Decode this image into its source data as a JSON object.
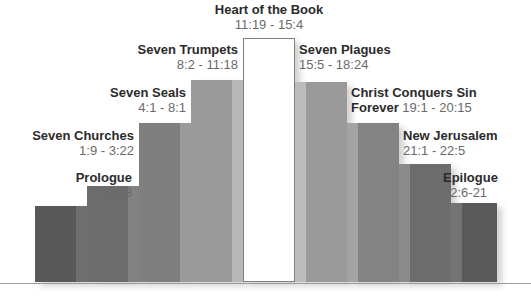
{
  "chart_data": {
    "type": "bar",
    "xlabel": "",
    "ylabel": "",
    "grid": false,
    "legend": null,
    "categories": [
      "Prologue",
      "Seven Churches",
      "Seven Seals",
      "Seven Trumpets",
      "Heart of the Book",
      "Seven Plagues",
      "Christ Conquers Sin Forever",
      "New Jerusalem",
      "Epilogue"
    ],
    "values": [
      76,
      96,
      159,
      202,
      244,
      200,
      159,
      118,
      79
    ],
    "ylim": [
      0,
      250
    ],
    "annotations": [
      "1:1-8",
      "1:9 - 3:22",
      "4:1 - 8:1",
      "8:2 - 11:18",
      "11:19 - 15:4",
      "15:5 - 18:24",
      "19:1 - 20:15",
      "21:1 - 22:5",
      "22:6-21"
    ],
    "bars": [
      {
        "index": 0,
        "side": "left",
        "title": "Prologue",
        "ref": "1:1-8",
        "fill": "#585858",
        "stripe": "#6f6f6f",
        "x": 35,
        "width": 52,
        "height": 76
      },
      {
        "index": 1,
        "side": "left",
        "title": "Seven Churches",
        "ref": "1:9 - 3:22",
        "fill": "#6c6c6c",
        "stripe": "#828282",
        "x": 87,
        "width": 52,
        "height": 96
      },
      {
        "index": 2,
        "side": "left",
        "title": "Seven Seals",
        "ref": "4:1 - 8:1",
        "fill": "#7f7f7f",
        "stripe": "#9b9b9b",
        "x": 139,
        "width": 52,
        "height": 159
      },
      {
        "index": 3,
        "side": "left",
        "title": "Seven Trumpets",
        "ref": "8:2 - 11:18",
        "fill": "#9a9a9a",
        "stripe": "#b8b8b8",
        "x": 191,
        "width": 52,
        "height": 202
      },
      {
        "index": 4,
        "side": "center",
        "title": "Heart of the Book",
        "ref": "11:19 - 15:4",
        "fill": "#ffffff",
        "stripe": "#ffffff",
        "x": 243,
        "width": 52,
        "height": 244
      },
      {
        "index": 5,
        "side": "right",
        "title": "Seven Plagues",
        "ref": "15:5 - 18:24",
        "fill": "#9a9a9a",
        "stripe": "#bcbcbc",
        "x": 295,
        "width": 52,
        "height": 200
      },
      {
        "index": 6,
        "side": "right",
        "title": "Christ Conquers Sin",
        "ref": "Forever 19:1 - 20:15",
        "fill": "#838383",
        "stripe": "#a4a4a4",
        "x": 347,
        "width": 52,
        "height": 159
      },
      {
        "index": 7,
        "side": "right",
        "title": "New Jerusalem",
        "ref": "21:1 - 22:5",
        "fill": "#6d6d6d",
        "stripe": "#8b8b8b",
        "x": 399,
        "width": 52,
        "height": 118
      },
      {
        "index": 8,
        "side": "right",
        "title": "Epilogue",
        "ref": "22:6-21",
        "fill": "#5a5a5a",
        "stripe": "#747474",
        "x": 451,
        "width": 46,
        "height": 79
      }
    ]
  },
  "labels": {
    "prologue": {
      "title": "Prologue",
      "ref": "1:1-8"
    },
    "seven_churches": {
      "title": "Seven Churches",
      "ref": "1:9 - 3:22"
    },
    "seven_seals": {
      "title": "Seven Seals",
      "ref": "4:1 - 8:1"
    },
    "seven_trumpets": {
      "title": "Seven Trumpets",
      "ref": "8:2 - 11:18"
    },
    "heart": {
      "title": "Heart of the Book",
      "ref": "11:19 - 15:4"
    },
    "seven_plagues": {
      "title": "Seven Plagues",
      "ref": "15:5 - 18:24"
    },
    "christ": {
      "title": "Christ Conquers Sin",
      "line2_bold": "Forever",
      "line2_ref": "19:1 - 20:15"
    },
    "new_jerusalem": {
      "title": "New Jerusalem",
      "ref": "21:1 - 22:5"
    },
    "epilogue": {
      "title": "Epilogue",
      "ref": "22:6-21"
    }
  },
  "colors": {
    "text_title": "#2b2b2b",
    "text_ref": "#6a6a6a",
    "baseline": "#9c9c9c",
    "background": "#ffffff"
  }
}
